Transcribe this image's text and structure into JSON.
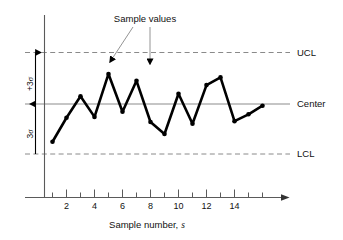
{
  "chart_data": {
    "type": "line",
    "title": "",
    "xlabel": "Sample number, s",
    "xlabel_main": "Sample number,",
    "xlabel_italic": "s",
    "ylabel": "",
    "xlim": [
      0.2,
      16.6
    ],
    "ylim": [
      -4.2,
      4.2
    ],
    "grid": false,
    "legend_position": "right-outside",
    "x": [
      1,
      2,
      3,
      4,
      5,
      6,
      7,
      8,
      9,
      10,
      11,
      12,
      13,
      14,
      15,
      16
    ],
    "values": [
      -2.2,
      -0.8,
      0.45,
      -0.75,
      1.75,
      -0.45,
      1.35,
      -1.05,
      -1.75,
      0.6,
      -1.15,
      1.1,
      1.55,
      -1.0,
      -0.6,
      -0.1
    ],
    "series": [
      {
        "name": "Sample values",
        "values": [
          -2.2,
          -0.8,
          0.45,
          -0.75,
          1.75,
          -0.45,
          1.35,
          -1.05,
          -1.75,
          0.6,
          -1.15,
          1.1,
          1.55,
          -1.0,
          -0.6,
          -0.1
        ]
      }
    ],
    "reference_lines": [
      {
        "id": "ucl",
        "label": "UCL",
        "value": 3,
        "style": "dashed"
      },
      {
        "id": "center",
        "label": "Center",
        "value": 0,
        "style": "solid"
      },
      {
        "id": "lcl",
        "label": "LCL",
        "value": -3,
        "style": "dashed"
      }
    ],
    "xticks": [
      1,
      2,
      3,
      4,
      5,
      6,
      7,
      8,
      9,
      10,
      11,
      12,
      13,
      14,
      15,
      16
    ],
    "xticklabels": [
      "",
      "2",
      "",
      "4",
      "",
      "6",
      "",
      "8",
      "",
      "10",
      "",
      "12",
      "",
      "14",
      "",
      ""
    ],
    "labeled_xticks": [
      "2",
      "4",
      "6",
      "8",
      "10",
      "12",
      "14"
    ],
    "yticks": [],
    "yticklabels": [],
    "annotations": [
      {
        "id": "sample-values",
        "text": "Sample values",
        "points_to": [
          5,
          7
        ]
      },
      {
        "id": "upper-sigma",
        "text": "+3σ",
        "text_sign": "+3",
        "text_symbol": "σ",
        "span": [
          0,
          3
        ],
        "orientation": "vertical"
      },
      {
        "id": "lower-sigma",
        "text": "3σ",
        "text_sign": "3",
        "text_symbol": "σ",
        "span": [
          -3,
          0
        ],
        "orientation": "vertical"
      }
    ],
    "colors": {
      "series": "#000000",
      "center_line": "#8c8c8c",
      "limit_line": "#8a8a8a",
      "axis": "#555555",
      "text": "#111111",
      "leader": "#777777"
    }
  },
  "labels": {
    "ucl": "UCL",
    "center": "Center",
    "lcl": "LCL",
    "sample_values": "Sample values",
    "sigma_upper_num": "+3",
    "sigma_lower_num": "3",
    "sigma_symbol": "σ",
    "xaxis_title_main": "Sample number,",
    "xaxis_title_italic": "s",
    "tick_2": "2",
    "tick_4": "4",
    "tick_6": "6",
    "tick_8": "8",
    "tick_10": "10",
    "tick_12": "12",
    "tick_14": "14"
  }
}
